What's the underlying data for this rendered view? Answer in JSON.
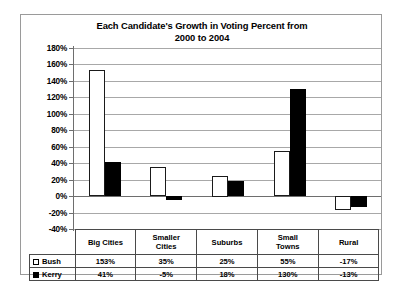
{
  "chart_data": {
    "type": "bar",
    "title": "Each Candidate's Growth in Voting Percent from 2000 to 2004",
    "title_line1": "Each Candidate's Growth in Voting Percent from",
    "title_line2": "2000 to 2004",
    "xlabel": "",
    "ylabel": "",
    "ylim": [
      -40,
      180
    ],
    "ytick_step": 20,
    "grid": true,
    "legend_position": "table-left",
    "categories": [
      "Big Cities",
      "Smaller Cities",
      "Suburbs",
      "Small Towns",
      "Rural"
    ],
    "category_lines": [
      [
        "Big Cities"
      ],
      [
        "Smaller",
        "Cities"
      ],
      [
        "Suburbs"
      ],
      [
        "Small",
        "Towns"
      ],
      [
        "Rural"
      ]
    ],
    "ytick_labels": [
      "180%",
      "160%",
      "140%",
      "120%",
      "100%",
      "80%",
      "60%",
      "40%",
      "20%",
      "0%",
      "-20%",
      "-40%"
    ],
    "ytick_values": [
      180,
      160,
      140,
      120,
      100,
      80,
      60,
      40,
      20,
      0,
      -20,
      -40
    ],
    "series": [
      {
        "name": "Bush",
        "swatch": "hollow",
        "color": "#ffffff",
        "values": [
          153,
          35,
          25,
          55,
          -17
        ],
        "labels": [
          "153%",
          "35%",
          "25%",
          "55%",
          "-17%"
        ]
      },
      {
        "name": "Kerry",
        "swatch": "filled",
        "color": "#000000",
        "values": [
          41,
          -5,
          18,
          130,
          -13
        ],
        "labels": [
          "41%",
          "-5%",
          "18%",
          "130%",
          "-13%"
        ]
      }
    ]
  }
}
